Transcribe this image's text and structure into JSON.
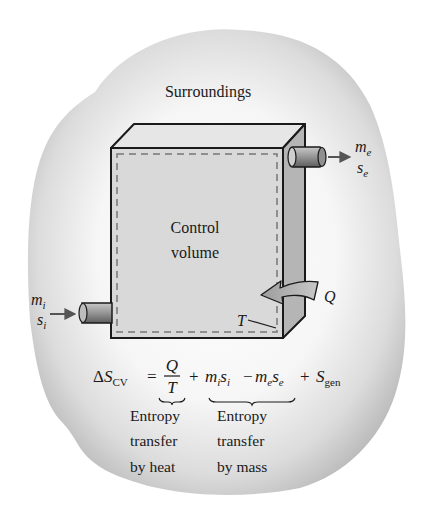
{
  "diagram": {
    "title_region_label": "Surroundings",
    "control_volume_label": [
      "Control",
      "volume"
    ],
    "boundary_temperature_label": "T",
    "heat_label": "Q",
    "inlet": {
      "mass_label": "m",
      "mass_sub": "i",
      "entropy_label": "s",
      "entropy_sub": "i"
    },
    "exit": {
      "mass_label": "m",
      "mass_sub": "e",
      "entropy_label": "s",
      "entropy_sub": "e"
    },
    "equation": {
      "lhs_delta": "Δ",
      "lhs_symbol": "S",
      "lhs_sub": "CV",
      "equals": "=",
      "frac_num": "Q",
      "frac_den": "T",
      "plus1": "+",
      "term_mi": "m",
      "term_mi_sub": "i",
      "term_si": "s",
      "term_si_sub": "i",
      "minus": "−",
      "term_me": "m",
      "term_me_sub": "e",
      "term_se": "s",
      "term_se_sub": "e",
      "plus2": "+",
      "gen_symbol": "S",
      "gen_sub": "gen"
    },
    "captions": {
      "heat": [
        "Entropy",
        "transfer",
        "by heat"
      ],
      "mass": [
        "Entropy",
        "transfer",
        "by mass"
      ]
    },
    "colors": {
      "background": "#ffffff",
      "surroundings_fill": "#c4c4c4",
      "surroundings_center": "#f4f4f4",
      "front_face": "#d9d9d9",
      "top_face": "#e6e6e6",
      "side_face": "#b5b5b5",
      "outline": "#1a1a1a",
      "dashed_boundary": "#777777",
      "pipe": "#8a8a8a",
      "arrow": "#555555",
      "heat_arrow": "#a9a9a9"
    }
  }
}
